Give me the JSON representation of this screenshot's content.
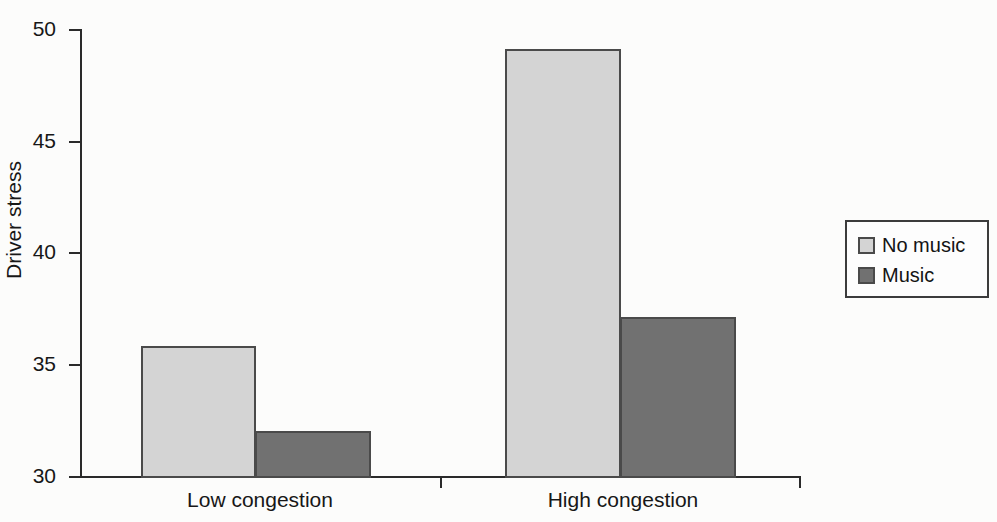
{
  "chart_data": {
    "type": "bar",
    "title": "",
    "xlabel": "",
    "ylabel": "Driver stress",
    "categories": [
      "Low congestion",
      "High congestion"
    ],
    "ylim": [
      30,
      50
    ],
    "yticks": [
      30,
      35,
      40,
      45,
      50
    ],
    "ytick_labels": [
      "30",
      "35",
      "40",
      "45",
      "50"
    ],
    "grid": false,
    "legend_position": "right",
    "series": [
      {
        "name": "No music",
        "values": [
          35.8,
          49.1
        ],
        "color": "#d4d4d4"
      },
      {
        "name": "Music",
        "values": [
          32.0,
          37.1
        ],
        "color": "#717171"
      }
    ]
  },
  "axes": {
    "y_title": "Driver stress",
    "tick_labels": {
      "t50": "50",
      "t45": "45",
      "t40": "40",
      "t35": "35",
      "t30": "30"
    },
    "group_labels": {
      "g0": "Low congestion",
      "g1": "High congestion"
    }
  },
  "legend": {
    "entries": [
      {
        "label": "No music",
        "swatch": "light"
      },
      {
        "label": "Music",
        "swatch": "dark"
      }
    ]
  }
}
